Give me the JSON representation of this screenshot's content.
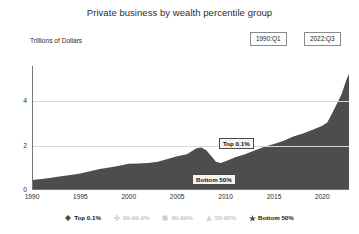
{
  "header": {
    "title": "Private business by wealth percentile group"
  },
  "axis": {
    "ylabel": "Trillions of Dollars",
    "yticks": [
      "0",
      "2",
      "4"
    ],
    "xticks": [
      "1990",
      "1995",
      "2000",
      "2005",
      "2010",
      "2015",
      "2020"
    ]
  },
  "controls": {
    "start_date": "1990:Q1",
    "end_date": "2022:Q3"
  },
  "annotations": [
    {
      "label": "Top 0.1%",
      "name": "annotation-top-01"
    },
    {
      "label": "Bottom 50%",
      "name": "annotation-bottom-50"
    }
  ],
  "legend": {
    "items": [
      {
        "label": "Top 0.1%",
        "marker": "diamond-marker-icon",
        "state": "active",
        "color": "#4a4a4a"
      },
      {
        "label": "99-99.9%",
        "marker": "plus-marker-icon",
        "state": "dim",
        "color": "#d2d2d2"
      },
      {
        "label": "90-99%",
        "marker": "square-marker-icon",
        "state": "dim",
        "color": "#cfcfcf"
      },
      {
        "label": "50-90%",
        "marker": "triangle-marker-icon",
        "state": "dim",
        "color": "#d4d4d4"
      },
      {
        "label": "Bottom 50%",
        "marker": "star-marker-icon",
        "state": "active",
        "color": "#4a4a4a"
      }
    ]
  },
  "chart_data": {
    "type": "area",
    "title": "Private business by wealth percentile group",
    "xlabel": "",
    "ylabel": "Trillions of Dollars",
    "xlim": [
      1990,
      2022.75
    ],
    "ylim": [
      0,
      5.6
    ],
    "grid": true,
    "legend_position": "bottom",
    "series_color": "#4d4d4d",
    "series": [
      {
        "name": "Top 0.1%",
        "x": [
          1990.0,
          1991.0,
          1992.0,
          1993.0,
          1994.0,
          1995.0,
          1996.0,
          1997.0,
          1998.0,
          1999.0,
          2000.0,
          2001.0,
          2002.0,
          2003.0,
          2004.0,
          2005.0,
          2006.0,
          2007.0,
          2007.5,
          2008.0,
          2008.5,
          2009.0,
          2009.5,
          2010.0,
          2011.0,
          2012.0,
          2013.0,
          2014.0,
          2015.0,
          2016.0,
          2017.0,
          2018.0,
          2019.0,
          2020.0,
          2020.5,
          2021.0,
          2021.5,
          2022.0,
          2022.5,
          2022.75
        ],
        "values": [
          0.45,
          0.5,
          0.55,
          0.62,
          0.68,
          0.75,
          0.85,
          0.95,
          1.02,
          1.1,
          1.18,
          1.2,
          1.22,
          1.28,
          1.4,
          1.52,
          1.62,
          1.88,
          1.92,
          1.8,
          1.55,
          1.28,
          1.22,
          1.3,
          1.48,
          1.62,
          1.78,
          1.95,
          2.08,
          2.22,
          2.42,
          2.55,
          2.72,
          2.9,
          3.05,
          3.45,
          3.9,
          4.35,
          5.0,
          5.25
        ]
      }
    ]
  }
}
